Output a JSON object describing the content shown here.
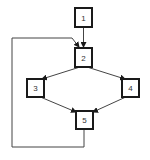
{
  "diagram": {
    "type": "flowchart",
    "colors": {
      "stroke": "#1a1a1a",
      "background": "#ffffff",
      "text": "#333333"
    },
    "nodes": [
      {
        "id": "1",
        "label": "1"
      },
      {
        "id": "2",
        "label": "2"
      },
      {
        "id": "3",
        "label": "3"
      },
      {
        "id": "4",
        "label": "4"
      },
      {
        "id": "5",
        "label": "5"
      }
    ],
    "edges": [
      {
        "from": "1",
        "to": "2"
      },
      {
        "from": "2",
        "to": "3"
      },
      {
        "from": "2",
        "to": "4"
      },
      {
        "from": "3",
        "to": "5"
      },
      {
        "from": "4",
        "to": "5"
      },
      {
        "from": "5",
        "to": "2",
        "note": "feedback loop around left side"
      }
    ]
  }
}
